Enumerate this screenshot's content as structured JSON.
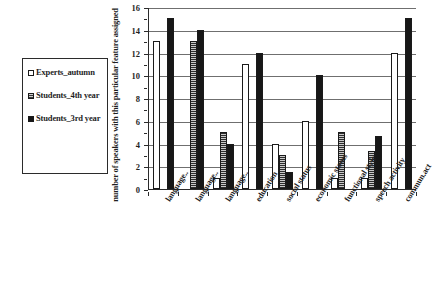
{
  "chart_data": {
    "type": "bar",
    "title": "",
    "xlabel": "",
    "ylabel": "number of speakers with this particular feature assigned",
    "ylim": [
      0,
      16
    ],
    "ytick_step": 2,
    "yticks": [
      0,
      2,
      4,
      6,
      8,
      10,
      12,
      14,
      16
    ],
    "grid": true,
    "legend_position": "left-outside",
    "categories": [
      "language..",
      "language..",
      "language..",
      "education",
      "social status",
      "economic status",
      "functional style",
      "speech activity",
      "commun.act"
    ],
    "series": [
      {
        "name": "Experts_autumn",
        "swatch": "open",
        "values": [
          13,
          0,
          1,
          11,
          4,
          6,
          1,
          1,
          12
        ]
      },
      {
        "name": "Students_4th year",
        "swatch": "hatched",
        "values": [
          0,
          13,
          5,
          0,
          3,
          0,
          5,
          3.3,
          0
        ]
      },
      {
        "name": "Students_3rd year",
        "swatch": "solid",
        "values": [
          15,
          14,
          4,
          12,
          1.5,
          10,
          0,
          4.7,
          15
        ]
      }
    ]
  },
  "legend": {
    "entries": [
      {
        "label": "Experts_autumn"
      },
      {
        "label": "Students_4th year"
      },
      {
        "label": "Students_3rd year"
      }
    ]
  },
  "axes": {
    "y_title": "number of speakers with this particular feature assigned"
  },
  "colors": {
    "series_open": "#ffffff",
    "series_hatched": "#9a9a9a",
    "series_solid": "#171717",
    "axis": "#2b2b2b",
    "grid": "#6f6f6f",
    "text": "#1f1f1f"
  }
}
